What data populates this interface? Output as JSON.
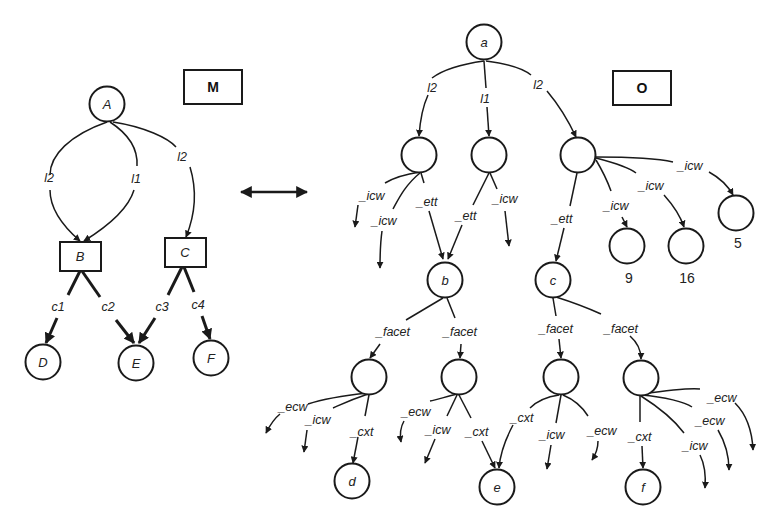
{
  "diagram": {
    "left_graph": {
      "title": "M",
      "nodes": [
        {
          "id": "A",
          "label": "A",
          "shape": "circle"
        },
        {
          "id": "B",
          "label": "B",
          "shape": "rect"
        },
        {
          "id": "C",
          "label": "C",
          "shape": "rect"
        },
        {
          "id": "D",
          "label": "D",
          "shape": "circle"
        },
        {
          "id": "E",
          "label": "E",
          "shape": "circle"
        },
        {
          "id": "F",
          "label": "F",
          "shape": "circle"
        }
      ],
      "edges": [
        {
          "from": "A",
          "to": "B",
          "label": "l2"
        },
        {
          "from": "A",
          "to": "B",
          "label": "l1"
        },
        {
          "from": "A",
          "to": "C",
          "label": "l2"
        },
        {
          "from": "B",
          "to": "D",
          "label": "c1"
        },
        {
          "from": "B",
          "to": "E",
          "label": "c2"
        },
        {
          "from": "C",
          "to": "E",
          "label": "c3"
        },
        {
          "from": "C",
          "to": "F",
          "label": "c4"
        }
      ]
    },
    "connector": "double-arrow",
    "right_graph": {
      "title": "O",
      "nodes": [
        {
          "id": "a",
          "label": "a"
        },
        {
          "id": "n1",
          "label": ""
        },
        {
          "id": "n2",
          "label": ""
        },
        {
          "id": "n3",
          "label": ""
        },
        {
          "id": "b",
          "label": "b"
        },
        {
          "id": "c",
          "label": "c"
        },
        {
          "id": "v9",
          "label": "",
          "caption": "9"
        },
        {
          "id": "v16",
          "label": "",
          "caption": "16"
        },
        {
          "id": "v5",
          "label": "",
          "caption": "5"
        },
        {
          "id": "f1",
          "label": ""
        },
        {
          "id": "f2",
          "label": ""
        },
        {
          "id": "f3",
          "label": ""
        },
        {
          "id": "f4",
          "label": ""
        },
        {
          "id": "d",
          "label": "d"
        },
        {
          "id": "e",
          "label": "e"
        },
        {
          "id": "f",
          "label": "f"
        }
      ],
      "edge_labels": {
        "a_n1": "l2",
        "a_n2": "l1",
        "a_n3": "l2",
        "n1_out1": "_icw",
        "n1_out2": "_icw",
        "n1_b": "_ett",
        "n2_b": "_ett",
        "n2_out": "_icw",
        "n3_c": "_ett",
        "n3_9": "_icw",
        "n3_16": "_icw",
        "n3_5": "_icw",
        "b_f1": "_facet",
        "b_f2": "_facet",
        "c_f3": "_facet",
        "c_f4": "_facet",
        "f1_ecw": "_ecw",
        "f1_icw": "_icw",
        "f1_d": "_cxt",
        "f2_ecw": "_ecw",
        "f2_icw": "_icw",
        "f2_e": "_cxt",
        "f3_e": "_cxt",
        "f3_icw": "_icw",
        "f3_ecw": "_ecw",
        "f4_f": "_cxt",
        "f4_icw": "_icw",
        "f4_ecw1": "_ecw",
        "f4_ecw2": "_ecw"
      }
    }
  }
}
